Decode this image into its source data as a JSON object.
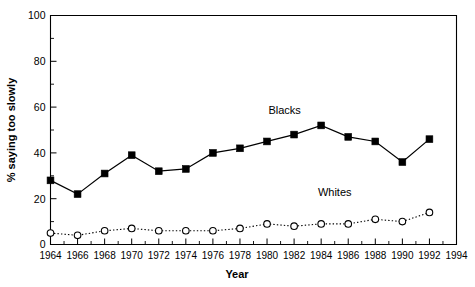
{
  "chart_data": {
    "type": "line",
    "title": "",
    "xlabel": "Year",
    "ylabel": "% saying too slowly",
    "x": [
      1964,
      1966,
      1968,
      1970,
      1972,
      1974,
      1976,
      1978,
      1980,
      1982,
      1984,
      1986,
      1988,
      1990,
      1992
    ],
    "categories": [
      "1964",
      "1966",
      "1968",
      "1970",
      "1972",
      "1974",
      "1976",
      "1978",
      "1980",
      "1982",
      "1984",
      "1986",
      "1988",
      "1990",
      "1992"
    ],
    "xlim": [
      1964,
      1994
    ],
    "ylim": [
      0,
      100
    ],
    "xticks": [
      "1964",
      "1966",
      "1968",
      "1970",
      "1972",
      "1974",
      "1976",
      "1978",
      "1980",
      "1982",
      "1984",
      "1986",
      "1988",
      "1990",
      "1992",
      "1994"
    ],
    "xtick_values": [
      1964,
      1966,
      1968,
      1970,
      1972,
      1974,
      1976,
      1978,
      1980,
      1982,
      1984,
      1986,
      1988,
      1990,
      1992,
      1994
    ],
    "yticks": [
      "0",
      "20",
      "40",
      "60",
      "80",
      "100"
    ],
    "ytick_values": [
      0,
      20,
      40,
      60,
      80,
      100
    ],
    "grid": false,
    "legend_position": "inline-annotation",
    "series": [
      {
        "name": "Blacks",
        "marker": "filled-square",
        "linestyle": "solid",
        "color": "#000000",
        "x": [
          1964,
          1966,
          1968,
          1970,
          1972,
          1974,
          1976,
          1978,
          1980,
          1982,
          1984,
          1986,
          1988,
          1990,
          1992
        ],
        "values": [
          28,
          22,
          31,
          39,
          32,
          33,
          40,
          42,
          45,
          48,
          52,
          47,
          45,
          36,
          46
        ]
      },
      {
        "name": "Whites",
        "marker": "open-circle",
        "linestyle": "dotted",
        "color": "#000000",
        "x": [
          1964,
          1966,
          1968,
          1970,
          1972,
          1974,
          1976,
          1978,
          1980,
          1982,
          1984,
          1986,
          1988,
          1990,
          1992
        ],
        "values": [
          5,
          4,
          6,
          7,
          6,
          6,
          6,
          7,
          9,
          8,
          9,
          9,
          11,
          10,
          14
        ]
      }
    ],
    "annotations": [
      {
        "text": "Blacks",
        "x": 1981.3,
        "y": 57
      },
      {
        "text": "Whites",
        "x": 1985.0,
        "y": 21
      }
    ]
  }
}
